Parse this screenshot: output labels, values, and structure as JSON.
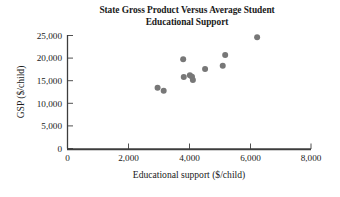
{
  "chart_data": {
    "type": "scatter",
    "title": "State Gross Product Versus Average Student Educational Support",
    "title_line1": "State Gross Product Versus Average Student",
    "title_line2": "Educational Support",
    "xlabel": "Educational support ($/child)",
    "ylabel": "GSP ($/child)",
    "xlim": [
      0,
      8000
    ],
    "ylim": [
      0,
      25000
    ],
    "xticks": [
      0,
      2000,
      4000,
      6000,
      8000
    ],
    "yticks": [
      0,
      5000,
      10000,
      15000,
      20000,
      25000
    ],
    "xtick_labels": [
      "0",
      "2,000",
      "4,000",
      "6,000",
      "8,000"
    ],
    "ytick_labels": [
      "0",
      "5,000",
      "10,000",
      "15,000",
      "20,000",
      "25,000"
    ],
    "grid": false,
    "legend": false,
    "marker_color": "#777777",
    "marker_size": 3.0,
    "points": [
      {
        "x": 2960,
        "y": 13450
      },
      {
        "x": 3160,
        "y": 12800
      },
      {
        "x": 3800,
        "y": 19750
      },
      {
        "x": 3820,
        "y": 15800
      },
      {
        "x": 4020,
        "y": 16200
      },
      {
        "x": 4090,
        "y": 15850
      },
      {
        "x": 4120,
        "y": 15150
      },
      {
        "x": 4520,
        "y": 17600
      },
      {
        "x": 5100,
        "y": 18300
      },
      {
        "x": 5180,
        "y": 20700
      },
      {
        "x": 6230,
        "y": 24600
      }
    ]
  }
}
